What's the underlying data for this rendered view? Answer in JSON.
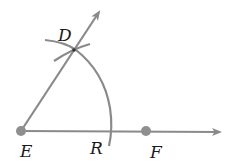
{
  "diagram": {
    "title": "",
    "colors": {
      "line": "#8a8a8a",
      "point": "#8f8f8f",
      "text": "#1a1a1a",
      "background": "#ffffff"
    },
    "points": [
      {
        "id": "E",
        "label": "E",
        "x": 21,
        "y": 131
      },
      {
        "id": "F",
        "label": "F",
        "x": 146,
        "y": 131
      },
      {
        "id": "D",
        "label": "D",
        "x": 73,
        "y": 50
      },
      {
        "id": "R",
        "label": "R",
        "x": 111,
        "y": 131
      }
    ],
    "rays": [
      {
        "from": "E",
        "through": "F",
        "label": "ray EF"
      },
      {
        "from": "E",
        "through": "D",
        "label": "ray ED"
      }
    ],
    "arcs": [
      {
        "center": "E",
        "label": "arc through D and R"
      },
      {
        "center": "R",
        "label": "crossing arc at D"
      }
    ],
    "labels": {
      "D": "D",
      "E": "E",
      "R": "R",
      "F": "F"
    }
  }
}
